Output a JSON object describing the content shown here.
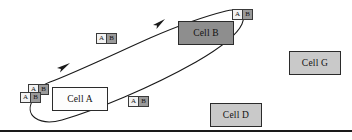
{
  "diagram": {
    "background_color": "#ffffff",
    "line_color": "#1a1a1a",
    "cells": [
      {
        "id": "cell-a",
        "label": "Cell A",
        "fill": "#fdfdfd",
        "style": "white",
        "x": 52,
        "y": 87,
        "w": 56,
        "h": 24
      },
      {
        "id": "cell-b",
        "label": "Cell B",
        "fill": "#8e8e8e",
        "style": "dark",
        "x": 178,
        "y": 21,
        "w": 56,
        "h": 24
      },
      {
        "id": "cell-g",
        "label": "Cell G",
        "fill": "#c9c9c9",
        "style": "light",
        "x": 289,
        "y": 51,
        "w": 52,
        "h": 24
      },
      {
        "id": "cell-d",
        "label": "Cell D",
        "fill": "#c9c9c9",
        "style": "light",
        "x": 210,
        "y": 103,
        "w": 52,
        "h": 24
      }
    ],
    "tokens": [
      {
        "id": "token-pair-cell-a-upper",
        "a_label": "A",
        "b_label": "B",
        "x": 28,
        "y": 84
      },
      {
        "id": "token-pair-cell-a-lower",
        "a_label": "A",
        "b_label": "B",
        "x": 20,
        "y": 92
      },
      {
        "id": "token-pair-upper-left",
        "a_label": "A",
        "b_label": "B",
        "x": 96,
        "y": 33
      },
      {
        "id": "token-pair-top-right",
        "a_label": "A",
        "b_label": "B",
        "x": 232,
        "y": 9
      },
      {
        "id": "token-pair-bottom-middle",
        "a_label": "A",
        "b_label": "B",
        "x": 128,
        "y": 96
      }
    ],
    "arrows": [
      {
        "id": "arrow-upper-right",
        "direction": "right"
      },
      {
        "id": "arrow-lower-left",
        "direction": "up-right"
      }
    ],
    "rule": {
      "id": "baseline-rule",
      "y": 130
    }
  }
}
